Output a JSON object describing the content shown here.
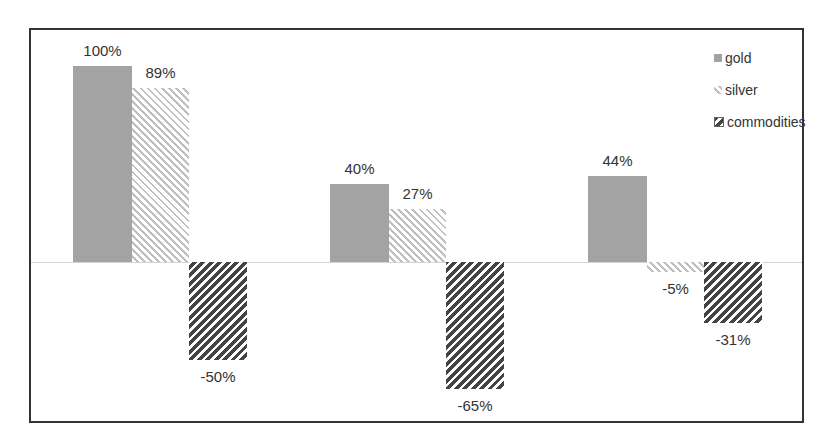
{
  "chart_data": {
    "type": "bar",
    "title": "",
    "xlabel": "",
    "ylabel": "",
    "categories": [
      "",
      "",
      ""
    ],
    "series": [
      {
        "name": "gold",
        "values": [
          100,
          40,
          44
        ],
        "labels": [
          "100%",
          "40%",
          "44%"
        ],
        "color": "#a3a3a3"
      },
      {
        "name": "silver",
        "values": [
          89,
          27,
          -5
        ],
        "labels": [
          "89%",
          "27%",
          "-5%"
        ],
        "color": "#bfbfbf"
      },
      {
        "name": "commodities",
        "values": [
          -50,
          -65,
          -31
        ],
        "labels": [
          "-50%",
          "-65%",
          "-31%"
        ],
        "color": "#444444"
      }
    ],
    "ylim": [
      -70,
      110
    ],
    "grid": false,
    "legend_position": "top-right",
    "value_format": "percent"
  }
}
